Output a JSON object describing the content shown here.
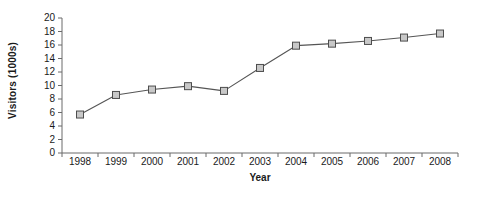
{
  "chart_data": {
    "type": "line",
    "title": "",
    "subtitle": "",
    "xlabel": "Year",
    "ylabel": "Visitors (1000s)",
    "categories": [
      "1998",
      "1999",
      "2000",
      "2001",
      "2002",
      "2003",
      "2004",
      "2005",
      "2006",
      "2007",
      "2008"
    ],
    "values": [
      5.7,
      8.6,
      9.4,
      9.9,
      9.2,
      12.6,
      15.9,
      16.2,
      16.6,
      17.1,
      17.7
    ],
    "series": [
      {
        "name": "Visitors",
        "values": [
          5.7,
          8.6,
          9.4,
          9.9,
          9.2,
          12.6,
          15.9,
          16.2,
          16.6,
          17.1,
          17.7
        ]
      }
    ],
    "ylim": [
      0,
      20
    ],
    "ytick_step": 2,
    "yticks": [
      0,
      2,
      4,
      6,
      8,
      10,
      12,
      14,
      16,
      18,
      20
    ],
    "ytick_labels": [
      "0",
      "2",
      "4",
      "6",
      "8",
      "10",
      "12",
      "14",
      "16",
      "18",
      "20"
    ],
    "grid": false,
    "legend": false,
    "legend_position": "none",
    "annotations": [],
    "colors": {
      "background": "#ffffff",
      "line": "#555555",
      "marker_fill": "#c8c8c8",
      "marker_stroke": "#4d4d4d",
      "axis": "#6b6b6b",
      "text": "#1a1a1a"
    },
    "marker": "square"
  }
}
